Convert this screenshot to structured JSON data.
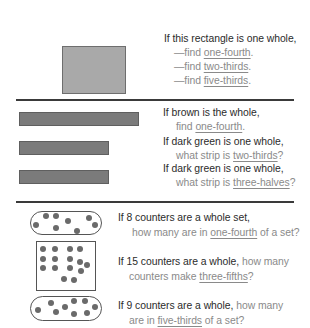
{
  "section1": {
    "prompt": "If this rectangle is one whole,",
    "items": [
      {
        "prefix": "—find ",
        "term": "one-fourth",
        "suffix": "."
      },
      {
        "prefix": "—find ",
        "term": "two-thirds",
        "suffix": "."
      },
      {
        "prefix": "—find ",
        "term": "five-thirds",
        "suffix": "."
      }
    ],
    "shape": "gray-rectangle"
  },
  "section2": {
    "questions": [
      {
        "line1": "If brown is the whole,",
        "line2_prefix": "find ",
        "term": "one-fourth",
        "line2_suffix": "."
      },
      {
        "line1": "If dark green is one whole,",
        "line2_prefix": "what strip is ",
        "term": "two-thirds",
        "line2_suffix": "?"
      },
      {
        "line1": "If dark green is one whole,",
        "line2_prefix": "what strip is ",
        "term": "three-halves",
        "line2_suffix": "?"
      }
    ],
    "strips": [
      {
        "name": "brown-strip",
        "width": 120
      },
      {
        "name": "dark-green-strip",
        "width": 90
      },
      {
        "name": "dark-green-strip",
        "width": 90
      }
    ]
  },
  "section3": {
    "questions": [
      {
        "line1_dark": "If 8 counters are a whole set,",
        "line1_light": "",
        "line2_prefix": "how many are in ",
        "term": "one-fourth",
        "line2_suffix": " of a set?",
        "counter_count": 8
      },
      {
        "line1_dark": "If 15 counters are a whole,",
        "line1_light": " how many",
        "line2_prefix": "counters make ",
        "term": "three-fifths",
        "line2_suffix": "?",
        "counter_count": 15
      },
      {
        "line1_dark": "If 9 counters are a whole,",
        "line1_light": " how many",
        "line2_prefix": "are in ",
        "term": "five-thirds",
        "line2_suffix": " of a set?",
        "counter_count": 9
      }
    ]
  },
  "colors": {
    "text_dark": "#2b2b2b",
    "text_light": "#8a8a8a",
    "rectangle_fill": "#a9a9a9",
    "strip_fill": "#7b7b7b",
    "counter_fill": "#6a6a6a",
    "divider": "#3a3a3a"
  }
}
